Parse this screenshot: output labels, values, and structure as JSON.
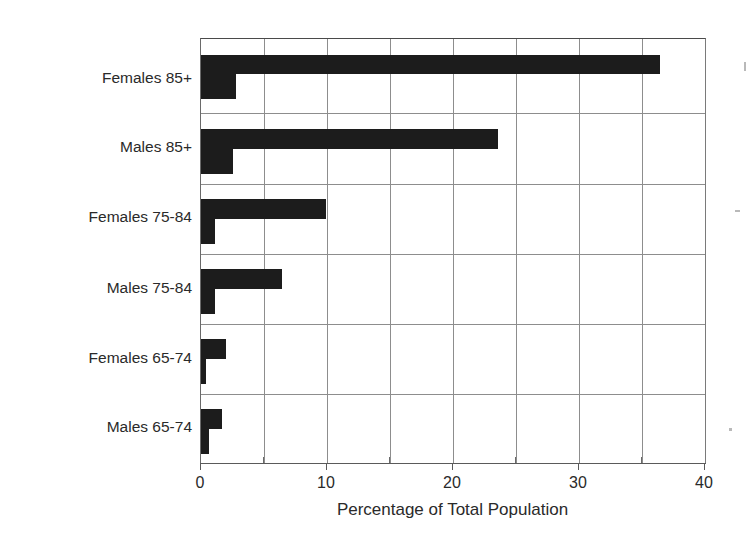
{
  "chart_data": {
    "type": "bar",
    "orientation": "horizontal",
    "title": "",
    "xlabel": "Percentage of Total Population",
    "ylabel": "Gender and Age Group",
    "categories": [
      "Females 85+",
      "Males 85+",
      "Females 75-84",
      "Males 75-84",
      "Females 65-74",
      "Males 65-74"
    ],
    "series": [
      {
        "name": "series-1",
        "values": [
          36.4,
          23.6,
          9.9,
          6.4,
          2.0,
          1.7
        ]
      },
      {
        "name": "series-2",
        "values": [
          2.8,
          2.5,
          1.1,
          1.1,
          0.4,
          0.6
        ]
      }
    ],
    "xlim": [
      0,
      40
    ],
    "xticks": [
      0,
      10,
      20,
      30,
      40
    ],
    "xtick_labels": [
      "0",
      "10",
      "20",
      "30",
      "40"
    ],
    "xminor_ticks": [
      5,
      15,
      25,
      35
    ],
    "gridlines_vertical": [
      5,
      10,
      15,
      20,
      25,
      30,
      35
    ],
    "grid": true,
    "legend": "none",
    "bar_color": "#1c1c1c",
    "grid_color": "#8d8d8d",
    "axis_color": "#5a5a5a",
    "background": "#ffffff"
  },
  "axes": {
    "x_title": "Percentage of Total Population",
    "y_title": "Gender and Age Group",
    "x_labels": [
      "0",
      "10",
      "20",
      "30",
      "40"
    ],
    "y_labels": [
      "Females 85+",
      "Males 85+",
      "Females 75-84",
      "Males 75-84",
      "Females 65-74",
      "Males 65-74"
    ]
  }
}
